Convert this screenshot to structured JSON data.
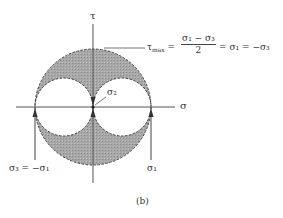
{
  "diagram": {
    "axes": {
      "horizontal_label": "σ",
      "vertical_label": "τ"
    },
    "equation": {
      "lhs": "τ",
      "lhs_sub": "max",
      "equals": "=",
      "numerator": "σ₁ − σ₃",
      "denominator": "2",
      "rhs": "= σ₁ = −σ₃"
    },
    "point_labels": {
      "center": "σ₂",
      "left": "σ₃ = −σ₁",
      "right": "σ₁"
    },
    "caption": "(b)",
    "colors": {
      "shade": "#9a9a9a",
      "line": "#444444",
      "background": "#ffffff"
    }
  }
}
